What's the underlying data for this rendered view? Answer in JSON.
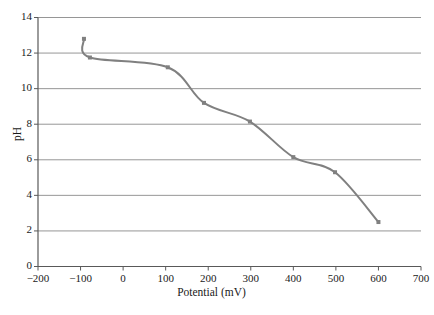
{
  "chart_data": {
    "type": "line",
    "title": "",
    "xlabel": "Potential (mV)",
    "ylabel": "pH",
    "xlim": [
      -200,
      700
    ],
    "ylim": [
      0,
      14
    ],
    "xticks": [
      -200,
      -100,
      0,
      100,
      200,
      300,
      400,
      500,
      600,
      700
    ],
    "xtick_labels": [
      "−200",
      "−100",
      "0",
      "100",
      "200",
      "300",
      "400",
      "500",
      "600",
      "700"
    ],
    "yticks": [
      0,
      2,
      4,
      6,
      8,
      10,
      12,
      14
    ],
    "ytick_labels": [
      "0",
      "2",
      "4",
      "6",
      "8",
      "10",
      "12",
      "14"
    ],
    "grid": {
      "horizontal": true,
      "vertical": false
    },
    "legend": null,
    "series": [
      {
        "name": "pH vs Potential",
        "color": "#808080",
        "marker": "square",
        "marker_color": "#808080",
        "line_width": 2,
        "x": [
          -92,
          -78,
          105,
          190,
          298,
          400,
          498,
          600
        ],
        "y": [
          12.8,
          11.75,
          11.2,
          9.2,
          8.15,
          6.15,
          5.3,
          2.5
        ]
      }
    ]
  },
  "axes": {
    "x_title": "Potential (mV)",
    "y_title": "pH"
  }
}
